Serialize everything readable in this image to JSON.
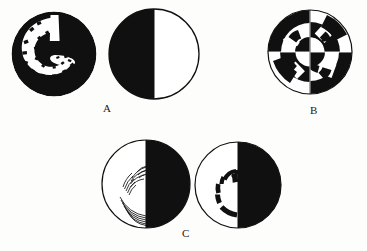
{
  "plate": {
    "width": 367,
    "height": 251,
    "background_color": "#fdfdfc",
    "ink_color": "#101010",
    "paper_color": "#ffffff",
    "caption_labels": [
      {
        "id": "label-a",
        "text": "A",
        "x": 103,
        "y": 103
      },
      {
        "id": "label-b",
        "text": "B",
        "x": 310,
        "y": 105
      },
      {
        "id": "label-c",
        "text": "C",
        "x": 182,
        "y": 228
      }
    ]
  },
  "figures": [
    {
      "id": "fig-a1",
      "group": "A",
      "position": "left",
      "x": 11,
      "y": 11,
      "size": 86,
      "description": "Solid black disk containing an irregular white hook / comma shaped blank region left of centre",
      "fill": "#101010",
      "inner_fill": "#ffffff",
      "outline": "none",
      "halves": "none"
    },
    {
      "id": "fig-a2",
      "group": "A",
      "position": "right",
      "x": 108,
      "y": 8,
      "size": 92,
      "description": "Circle with thin black outline; left half solid black, right half white",
      "fill": "#101010",
      "inner_fill": "#ffffff",
      "outline": "#101010",
      "halves": "left-black"
    },
    {
      "id": "fig-b",
      "group": "B",
      "position": "single",
      "x": 267,
      "y": 9,
      "size": 86,
      "description": "Circle with thin outline divided into four quadrants; concentric rings alternate black and white producing hook shapes in each quadrant",
      "fill": "#101010",
      "inner_fill": "#ffffff",
      "outline": "#101010",
      "halves": "radial-checker"
    },
    {
      "id": "fig-c1",
      "group": "C",
      "position": "left",
      "x": 101,
      "y": 139,
      "size": 90,
      "description": "Circle with thin outline; right half solid black, left white half filled with groups of fine concentric arc hatch lines",
      "fill": "#101010",
      "inner_fill": "#ffffff",
      "outline": "#101010",
      "halves": "right-black"
    },
    {
      "id": "fig-c2",
      "group": "C",
      "position": "right",
      "x": 194,
      "y": 141,
      "size": 88,
      "description": "Circle with thin outline; right half solid black, left white half containing thick broken black arc segments forming a C",
      "fill": "#101010",
      "inner_fill": "#ffffff",
      "outline": "#101010",
      "halves": "right-black"
    }
  ]
}
